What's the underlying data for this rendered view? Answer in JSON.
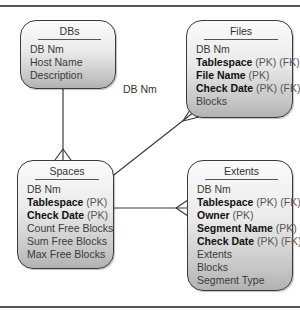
{
  "diagram": {
    "relationship_label": "DB Nm",
    "entities": {
      "dbs": {
        "title": "DBs",
        "attributes": [
          {
            "name": "DB Nm",
            "key": false,
            "suffix": ""
          },
          {
            "name": "Host Name",
            "key": false,
            "suffix": ""
          },
          {
            "name": "Description",
            "key": false,
            "suffix": ""
          }
        ]
      },
      "files": {
        "title": "Files",
        "attributes": [
          {
            "name": "DB Nm",
            "key": false,
            "suffix": ""
          },
          {
            "name": "Tablespace",
            "key": true,
            "suffix": " (PK) (FK)"
          },
          {
            "name": "File Name",
            "key": true,
            "suffix": " (PK)"
          },
          {
            "name": "Check Date",
            "key": true,
            "suffix": " (PK) (FK)"
          },
          {
            "name": "Blocks",
            "key": false,
            "suffix": ""
          }
        ]
      },
      "spaces": {
        "title": "Spaces",
        "attributes": [
          {
            "name": "DB Nm",
            "key": false,
            "suffix": ""
          },
          {
            "name": "Tablespace",
            "key": true,
            "suffix": " (PK)"
          },
          {
            "name": "Check Date",
            "key": true,
            "suffix": " (PK)"
          },
          {
            "name": "Count Free Blocks",
            "key": false,
            "suffix": ""
          },
          {
            "name": "Sum Free Blocks",
            "key": false,
            "suffix": ""
          },
          {
            "name": "Max Free Blocks",
            "key": false,
            "suffix": ""
          }
        ]
      },
      "extents": {
        "title": "Extents",
        "attributes": [
          {
            "name": "DB Nm",
            "key": false,
            "suffix": ""
          },
          {
            "name": "Tablespace",
            "key": true,
            "suffix": " (PK) (FK)"
          },
          {
            "name": "Owner",
            "key": true,
            "suffix": " (PK)"
          },
          {
            "name": "Segment Name",
            "key": true,
            "suffix": " (PK)"
          },
          {
            "name": "Check Date",
            "key": true,
            "suffix": " (PK) (FK)"
          },
          {
            "name": "Extents",
            "key": false,
            "suffix": ""
          },
          {
            "name": "Blocks",
            "key": false,
            "suffix": ""
          },
          {
            "name": "Segment Type",
            "key": false,
            "suffix": ""
          }
        ]
      }
    },
    "relationships": [
      {
        "from": "DBs",
        "to": "Spaces",
        "cardinality": "one-to-many"
      },
      {
        "from": "Spaces",
        "to": "Files",
        "cardinality": "one-to-many"
      },
      {
        "from": "Spaces",
        "to": "Extents",
        "cardinality": "one-to-many"
      }
    ],
    "colors": {
      "line": "#3a3a3a",
      "box_top": "#fbfbfb",
      "box_bottom": "#b2b2b2",
      "text": "#3a3a3a",
      "key_text": "#111111"
    }
  }
}
